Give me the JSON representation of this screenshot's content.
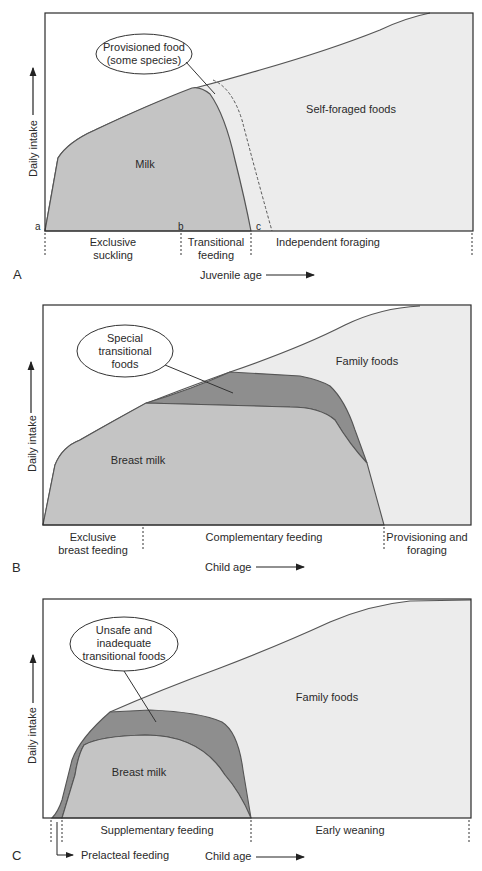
{
  "colors": {
    "frame": "#2b2b2b",
    "self_foraged_fill": "#ececec",
    "milk_fill": "#c4c4c4",
    "transitional_fill": "#8e8e8e",
    "curve": "#555555",
    "background": "#ffffff"
  },
  "panels": [
    {
      "letter": "A",
      "y_axis_label": "Daily intake",
      "x_axis_label": "Juvenile age",
      "region_labels": {
        "milk": "Milk",
        "solid": "Self-foraged foods"
      },
      "callout": [
        "Provisioned food",
        "(some species)"
      ],
      "point_labels": [
        "a",
        "b",
        "c"
      ],
      "phases": [
        {
          "lines": [
            "Exclusive",
            "suckling"
          ]
        },
        {
          "lines": [
            "Transitional",
            "feeding"
          ]
        },
        {
          "lines": [
            "Independent foraging"
          ]
        }
      ]
    },
    {
      "letter": "B",
      "y_axis_label": "Daily intake",
      "x_axis_label": "Child age",
      "region_labels": {
        "milk": "Breast milk",
        "solid": "Family foods"
      },
      "callout": [
        "Special",
        "transitional",
        "foods"
      ],
      "phases": [
        {
          "lines": [
            "Exclusive",
            "breast feeding"
          ]
        },
        {
          "lines": [
            "Complementary feeding"
          ]
        },
        {
          "lines": [
            "Provisioning and",
            "foraging"
          ]
        }
      ]
    },
    {
      "letter": "C",
      "y_axis_label": "Daily intake",
      "x_axis_label": "Child age",
      "region_labels": {
        "milk": "Breast milk",
        "solid": "Family foods"
      },
      "callout": [
        "Unsafe and",
        "inadequate",
        "transitional foods"
      ],
      "phases": [
        {
          "lines": [
            "Supplementary feeding"
          ]
        },
        {
          "lines": [
            "Early weaning"
          ]
        }
      ],
      "prelacteal_label": "Prelacteal feeding"
    }
  ]
}
